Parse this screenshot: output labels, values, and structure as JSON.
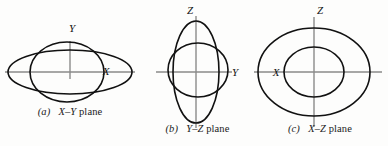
{
  "figure": {
    "background_color": "#fdfdfc",
    "curve_color": "#111111",
    "axis_color": "#8a8a8a",
    "label_color": "#111111"
  },
  "panels": [
    {
      "id": "a",
      "index_label": "(a)",
      "caption_axes": "X–Y",
      "caption_suffix": " plane",
      "caption_full": "(a) X–Y plane",
      "axes": [
        {
          "name": "horizontal-axis",
          "label": "X",
          "label_x": 106,
          "label_y": 75
        },
        {
          "name": "vertical-axis",
          "label": "Y",
          "label_x": 72,
          "label_y": 32
        }
      ],
      "curves": [
        {
          "name": "outer-ellipse",
          "cx": 70,
          "cy": 72,
          "rx": 62,
          "ry": 22
        },
        {
          "name": "inner-ellipse",
          "cx": 67,
          "cy": 72,
          "rx": 37,
          "ry": 30
        }
      ]
    },
    {
      "id": "b",
      "index_label": "(b)",
      "caption_axes": "Y–Z",
      "caption_suffix": " plane",
      "caption_full": "(b) Y–Z plane",
      "axes": [
        {
          "name": "horizontal-axis",
          "label": "Y",
          "label_x": 95,
          "label_y": 76
        },
        {
          "name": "vertical-axis",
          "label": "Z",
          "label_x": 50,
          "label_y": 14
        }
      ],
      "curves": [
        {
          "name": "outer-ellipse",
          "cx": 56,
          "cy": 72,
          "rx": 23,
          "ry": 51
        },
        {
          "name": "inner-ellipse",
          "cx": 58,
          "cy": 70,
          "rx": 30,
          "ry": 27
        }
      ]
    },
    {
      "id": "c",
      "index_label": "(c)",
      "caption_axes": "X–Z",
      "caption_suffix": " plane",
      "caption_full": "(c) X–Z plane",
      "axes": [
        {
          "name": "horizontal-axis",
          "label": "X",
          "label_x": 24,
          "label_y": 76
        },
        {
          "name": "vertical-axis",
          "label": "Z",
          "label_x": 68,
          "label_y": 14
        }
      ],
      "curves": [
        {
          "name": "outer-ellipse",
          "cx": 62,
          "cy": 72,
          "rx": 56,
          "ry": 44
        },
        {
          "name": "inner-ellipse",
          "cx": 62,
          "cy": 72,
          "rx": 30,
          "ry": 25
        }
      ]
    }
  ]
}
